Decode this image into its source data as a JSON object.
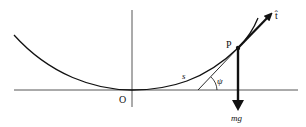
{
  "diagram": {
    "labels": {
      "origin": "O",
      "point": "P",
      "arc_length": "s",
      "angle": "ψ",
      "tangent": "t̂",
      "weight": "mg"
    },
    "colors": {
      "ink": "#111111",
      "axis": "#444444",
      "background": "#ffffff"
    }
  }
}
